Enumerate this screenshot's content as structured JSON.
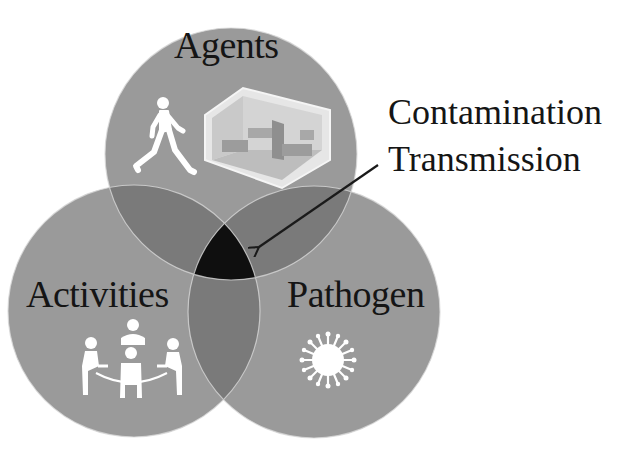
{
  "diagram": {
    "type": "venn",
    "sets": [
      {
        "id": "agents",
        "label": "Agents",
        "icons": [
          "walking-person-icon",
          "hospital-room-icon"
        ]
      },
      {
        "id": "activities",
        "label": "Activities",
        "icons": [
          "meeting-table-icon"
        ]
      },
      {
        "id": "pathogen",
        "label": "Pathogen",
        "icons": [
          "virus-icon"
        ]
      }
    ],
    "intersection": {
      "sets": [
        "agents",
        "activities",
        "pathogen"
      ],
      "label_line1": "Contamination",
      "label_line2": "Transmission"
    },
    "colors": {
      "single": "#9a9a9a",
      "double": "#7a7a7a",
      "triple": "#0f0f0f",
      "outline": "#d8d8d8",
      "arrow": "#1a1a1a",
      "text": "#151515"
    }
  }
}
